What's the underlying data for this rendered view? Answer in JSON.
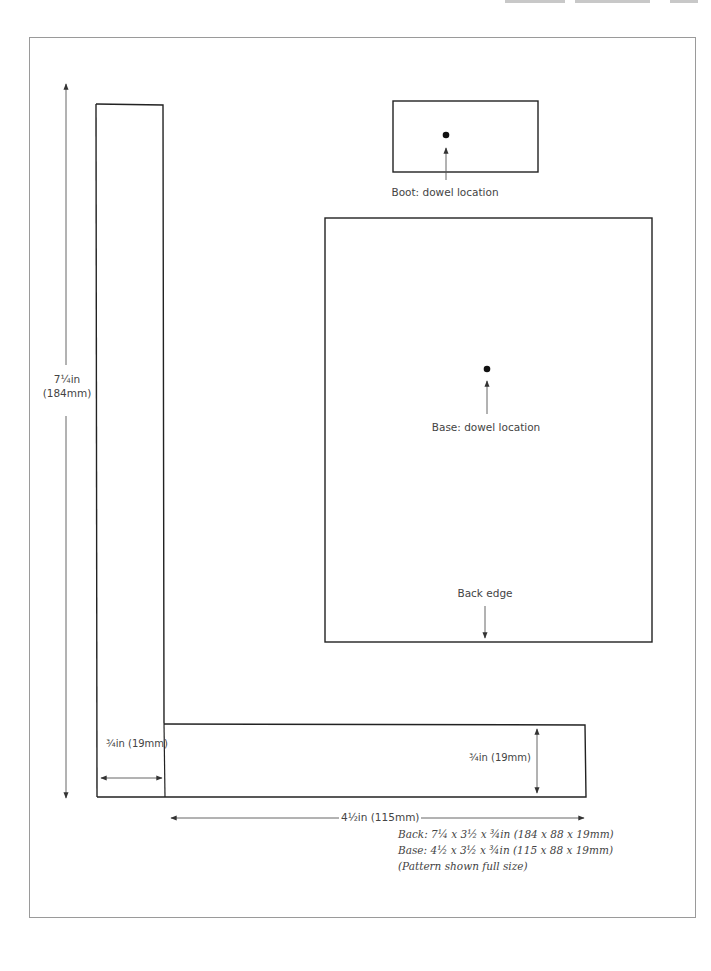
{
  "page": {
    "header_visible": "partially cut off"
  },
  "pattern": {
    "pieces": [
      {
        "name": "Back",
        "dimensions_label": "7¼in (184mm)"
      },
      {
        "name": "Base"
      },
      {
        "name": "Boot"
      }
    ],
    "labels": {
      "back_height": "7¼in",
      "back_height_mm": "(184mm)",
      "boot_dowel": "Boot: dowel location",
      "base_dowel": "Base: dowel location",
      "back_edge": "Back edge",
      "back_thickness": "¾in (19mm)",
      "base_thickness": "¾in (19mm)",
      "base_length": "4½in (115mm)"
    },
    "caption": {
      "line1": "Back: 7¼ x 3½ x ¾in (184 x 88 x 19mm)",
      "line2": "Base: 4½ x 3½ x ¾in (115 x 88 x 19mm)",
      "line3": "(Pattern shown full size)"
    }
  },
  "colors": {
    "line": "#222222",
    "dim_line": "#555555",
    "frame": "#9a9a9a"
  }
}
